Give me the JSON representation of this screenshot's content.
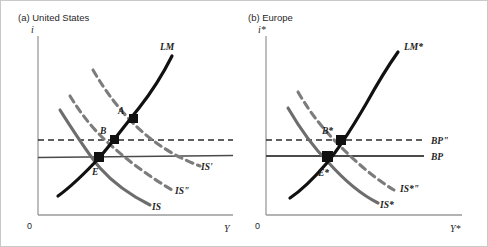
{
  "figure": {
    "background": "#ffffff",
    "frame_color": "#c8c8c8"
  },
  "colors": {
    "lm_curve": "#111111",
    "is_curve": "#6d6d6d",
    "is_dashed": "#7c7c7c",
    "bp_line": "#4a4a4a",
    "bp_dashed": "#2b2b2b",
    "axis": "#9a9a9a",
    "point_marker": "#111111",
    "text": "#1f1f1f"
  },
  "panels": [
    {
      "id": "panel-a",
      "title": "(a) United States",
      "axes": {
        "y_label": "i",
        "x_label": "Y",
        "origin_label": "0"
      },
      "curves": [
        {
          "name": "LM",
          "label": "LM",
          "style": "solid",
          "color_role": "lm_curve"
        },
        {
          "name": "IS",
          "label": "IS",
          "style": "solid",
          "color_role": "is_curve"
        },
        {
          "name": "IS''",
          "label": "IS\"",
          "style": "dashed",
          "color_role": "is_dashed"
        },
        {
          "name": "IS'",
          "label": "IS'",
          "style": "dashed",
          "color_role": "is_dashed"
        }
      ],
      "lines": [
        {
          "name": "BP",
          "label": "",
          "style": "solid",
          "color_role": "bp_line"
        },
        {
          "name": "BP''",
          "label": "",
          "style": "dashed",
          "color_role": "bp_dashed"
        }
      ],
      "points": [
        {
          "name": "A",
          "label": "A",
          "description": "intersection of LM and IS'"
        },
        {
          "name": "B",
          "label": "B",
          "description": "intersection of LM, IS'' and BP''"
        },
        {
          "name": "E",
          "label": "E",
          "description": "intersection of LM, IS and BP"
        }
      ]
    },
    {
      "id": "panel-b",
      "title": "(b) Europe",
      "axes": {
        "y_label": "i*",
        "x_label": "Y*",
        "origin_label": "0"
      },
      "curves": [
        {
          "name": "LM*",
          "label": "LM*",
          "style": "solid",
          "color_role": "lm_curve"
        },
        {
          "name": "IS*",
          "label": "IS*",
          "style": "solid",
          "color_role": "is_curve"
        },
        {
          "name": "IS*''",
          "label": "IS*\"",
          "style": "dashed",
          "color_role": "is_dashed"
        }
      ],
      "lines": [
        {
          "name": "BP",
          "label": "BP",
          "style": "solid",
          "color_role": "bp_line"
        },
        {
          "name": "BP''",
          "label": "BP\"",
          "style": "dashed",
          "color_role": "bp_dashed"
        }
      ],
      "points": [
        {
          "name": "B*",
          "label": "B*",
          "description": "intersection of LM*, IS*'' and BP''"
        },
        {
          "name": "E*",
          "label": "E*",
          "description": "intersection of LM*, IS* and BP"
        }
      ]
    }
  ],
  "labels": {
    "panel_a_title": "(a) United States",
    "panel_a_yaxis": "i",
    "panel_a_xaxis": "Y",
    "panel_a_origin": "0",
    "panel_a_lm": "LM",
    "panel_a_is": "IS",
    "panel_a_is_double_prime": "IS\"",
    "panel_a_is_prime": "IS'",
    "panel_a_point_a": "A",
    "panel_a_point_b": "B",
    "panel_a_point_e": "E",
    "panel_b_title": "(b) Europe",
    "panel_b_yaxis": "i*",
    "panel_b_xaxis": "Y*",
    "panel_b_origin": "0",
    "panel_b_lm": "LM*",
    "panel_b_is": "IS*",
    "panel_b_is_double_prime": "IS*\"",
    "panel_b_bp": "BP",
    "panel_b_bp_double_prime": "BP\"",
    "panel_b_point_b": "B*",
    "panel_b_point_e": "E*"
  }
}
